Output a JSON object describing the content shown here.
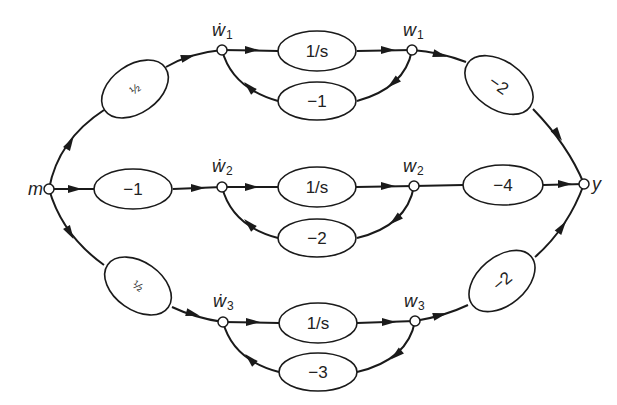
{
  "diagram": {
    "type": "signal-flow-graph",
    "nodes": {
      "input": {
        "label": "m"
      },
      "output": {
        "label": "y"
      },
      "w1dot": {
        "label": "ẇ",
        "sub": "1"
      },
      "w1": {
        "label": "w",
        "sub": "1"
      },
      "w2dot": {
        "label": "ẇ",
        "sub": "2"
      },
      "w2": {
        "label": "w",
        "sub": "2"
      },
      "w3dot": {
        "label": "ẇ",
        "sub": "3"
      },
      "w3": {
        "label": "w",
        "sub": "3"
      }
    },
    "gains": {
      "m_to_w1dot": "½",
      "m_to_w2dot": "−1",
      "m_to_w3dot": "½",
      "w1dot_to_w1": "1/s",
      "w1_feedback": "−1",
      "w2dot_to_w2": "1/s",
      "w2_feedback": "−2",
      "w3dot_to_w3": "1/s",
      "w3_feedback": "−3",
      "w1_to_y": "−2",
      "w2_to_y": "−4",
      "w3_to_y": "−2"
    }
  }
}
